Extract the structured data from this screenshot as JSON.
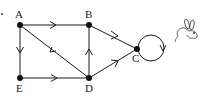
{
  "diagram": {
    "type": "directed-graph",
    "nodes": [
      {
        "id": "A",
        "label": "A",
        "x": 20,
        "y": 25
      },
      {
        "id": "B",
        "label": "B",
        "x": 89,
        "y": 25
      },
      {
        "id": "C",
        "label": "C",
        "x": 137,
        "y": 49
      },
      {
        "id": "D",
        "label": "D",
        "x": 89,
        "y": 78
      },
      {
        "id": "E",
        "label": "E",
        "x": 20,
        "y": 78
      }
    ],
    "edges": [
      {
        "from": "A",
        "to": "B"
      },
      {
        "from": "A",
        "to": "E"
      },
      {
        "from": "D",
        "to": "A"
      },
      {
        "from": "B",
        "to": "C"
      },
      {
        "from": "D",
        "to": "B"
      },
      {
        "from": "E",
        "to": "D"
      },
      {
        "from": "D",
        "to": "C"
      },
      {
        "from": "C",
        "to": "C",
        "kind": "self-loop"
      }
    ],
    "decoration": "rabbit-sketch",
    "colors": {
      "ink": "#1a1a1a",
      "background": "#ffffff"
    }
  }
}
